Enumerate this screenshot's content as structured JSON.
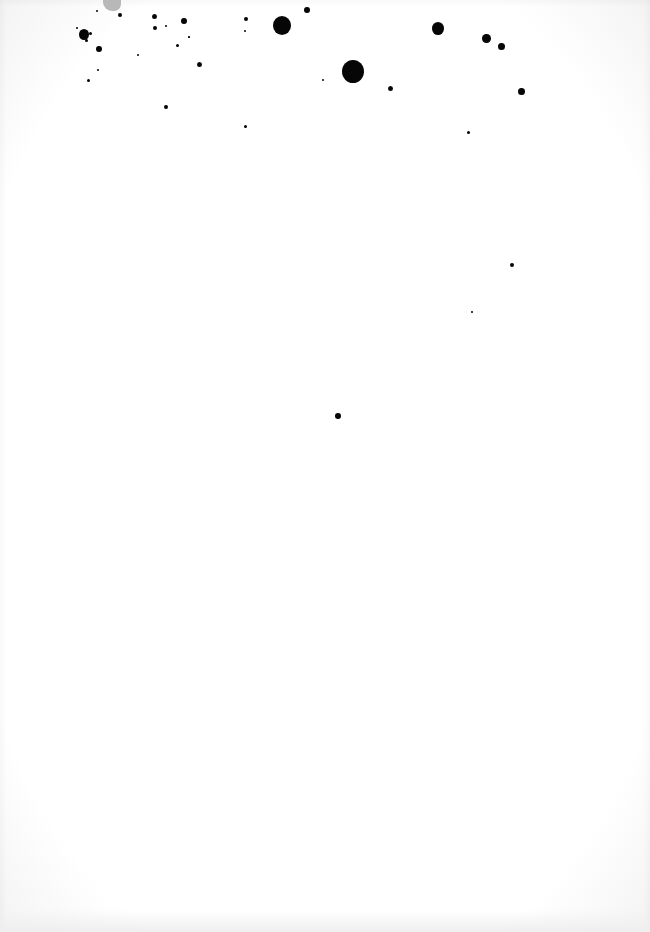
{
  "page": {
    "background": "#ffffff",
    "ink_color": "#060606",
    "smudge_color": "#b8b8b8",
    "text_content": ""
  },
  "ink_spots": [
    {
      "x": 84,
      "y": 34,
      "r": 5
    },
    {
      "x": 90,
      "y": 33,
      "r": 1.5
    },
    {
      "x": 86,
      "y": 40,
      "r": 1.5
    },
    {
      "x": 77,
      "y": 28,
      "r": 1
    },
    {
      "x": 99,
      "y": 49,
      "r": 3
    },
    {
      "x": 98,
      "y": 70,
      "r": 1.2
    },
    {
      "x": 88,
      "y": 80,
      "r": 1.5
    },
    {
      "x": 97,
      "y": 11,
      "r": 1
    },
    {
      "x": 120,
      "y": 15,
      "r": 1.8
    },
    {
      "x": 154,
      "y": 16,
      "r": 2.5
    },
    {
      "x": 155,
      "y": 28,
      "r": 2
    },
    {
      "x": 166,
      "y": 26,
      "r": 1.2
    },
    {
      "x": 184,
      "y": 21,
      "r": 3
    },
    {
      "x": 177,
      "y": 45,
      "r": 1.5
    },
    {
      "x": 189,
      "y": 37,
      "r": 0.8
    },
    {
      "x": 138,
      "y": 55,
      "r": 1
    },
    {
      "x": 199,
      "y": 64,
      "r": 2.5
    },
    {
      "x": 166,
      "y": 107,
      "r": 1.8
    },
    {
      "x": 246,
      "y": 19,
      "r": 2
    },
    {
      "x": 245,
      "y": 31,
      "r": 1.2
    },
    {
      "x": 282,
      "y": 25,
      "r": 9
    },
    {
      "x": 307,
      "y": 10,
      "r": 3
    },
    {
      "x": 323,
      "y": 80,
      "r": 1.2
    },
    {
      "x": 245,
      "y": 126,
      "r": 1.5
    },
    {
      "x": 353,
      "y": 71,
      "r": 11
    },
    {
      "x": 390,
      "y": 88,
      "r": 2.5
    },
    {
      "x": 438,
      "y": 28,
      "r": 6
    },
    {
      "x": 486,
      "y": 38,
      "r": 4.5
    },
    {
      "x": 501,
      "y": 46,
      "r": 3.5
    },
    {
      "x": 521,
      "y": 91,
      "r": 3.5
    },
    {
      "x": 468,
      "y": 132,
      "r": 1.5
    },
    {
      "x": 512,
      "y": 265,
      "r": 2.2
    },
    {
      "x": 472,
      "y": 312,
      "r": 1.2
    },
    {
      "x": 338,
      "y": 416,
      "r": 3
    }
  ]
}
